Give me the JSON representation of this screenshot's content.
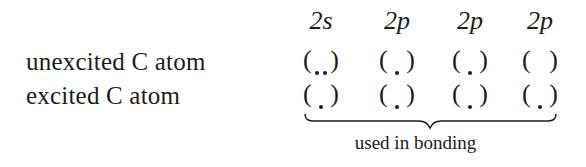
{
  "headers": [
    {
      "label": "2s",
      "x": 291
    },
    {
      "label": "2p",
      "x": 367
    },
    {
      "label": "2p",
      "x": 440
    },
    {
      "label": "2p",
      "x": 510
    }
  ],
  "rows": [
    {
      "label": "unexcited C atom",
      "orbitals": [
        {
          "electrons": 2
        },
        {
          "electrons": 1
        },
        {
          "electrons": 1
        },
        {
          "electrons": 0
        }
      ]
    },
    {
      "label": "excited C atom",
      "orbitals": [
        {
          "electrons": 1
        },
        {
          "electrons": 1
        },
        {
          "electrons": 1
        },
        {
          "electrons": 1
        }
      ]
    }
  ],
  "paren_open": "(",
  "paren_close": ")",
  "brace_caption": "used in bonding"
}
